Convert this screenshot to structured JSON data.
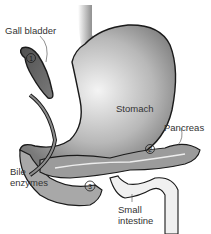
{
  "diagram": {
    "type": "anatomical illustration",
    "labels": {
      "gall_bladder": "Gall bladder",
      "stomach": "Stomach",
      "pancreas": "Pancreas",
      "bile_enzymes": "Bile\nenzymes",
      "small_intestine": "Small\nintestine"
    },
    "markers": [
      {
        "number": "1",
        "location": "gall bladder"
      },
      {
        "number": "2",
        "location": "pancreas"
      },
      {
        "number": "3",
        "location": "duodenum"
      }
    ]
  }
}
